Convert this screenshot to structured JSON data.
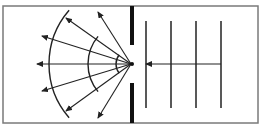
{
  "colors": {
    "background": "#ffffff",
    "frame": "#7a7a7a",
    "line": "#222222",
    "barrier": "#111111"
  },
  "frame": {
    "x": 3,
    "y": 6,
    "w": 255,
    "h": 117
  },
  "barrier": {
    "x": 130,
    "w": 4,
    "upper": {
      "y1": 6,
      "y2": 45
    },
    "lower": {
      "y1": 83,
      "y2": 123
    }
  },
  "slit_point": {
    "x": 131,
    "y": 64
  },
  "incident_wavefronts": {
    "x": [
      146,
      171,
      196,
      221
    ],
    "y1": 21,
    "y2": 108
  },
  "incident_direction_arrow": {
    "x1": 221,
    "y1": 64,
    "x2": 146,
    "y2": 64
  },
  "diffracted_wavefronts": [
    {
      "radius": 15,
      "start_deg": 142,
      "end_deg": 218
    },
    {
      "radius": 43,
      "start_deg": 140,
      "end_deg": 220
    },
    {
      "radius": 82,
      "start_deg": 139,
      "end_deg": 221
    }
  ],
  "diffracted_rays": [
    {
      "x2": 98,
      "y2": 12
    },
    {
      "x2": 66,
      "y2": 18
    },
    {
      "x2": 42,
      "y2": 36
    },
    {
      "x2": 37,
      "y2": 64
    },
    {
      "x2": 42,
      "y2": 91
    },
    {
      "x2": 66,
      "y2": 111
    },
    {
      "x2": 98,
      "y2": 118
    }
  ]
}
